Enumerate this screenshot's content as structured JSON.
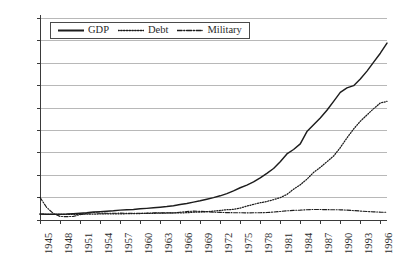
{
  "chart_data": {
    "type": "line",
    "title": "",
    "xlabel": "",
    "ylabel": "",
    "xlim": [
      1945,
      1997
    ],
    "ylim": [
      0,
      9000
    ],
    "grid": true,
    "legend_position": "top-left-inside",
    "y_ticks": [
      "9,000",
      "8,000",
      "7,000",
      "6,000",
      "5,000",
      "4,000",
      "3,000",
      "2,000",
      "1,000",
      "0"
    ],
    "y_tick_values": [
      9000,
      8000,
      7000,
      6000,
      5000,
      4000,
      3000,
      2000,
      1000,
      0
    ],
    "x_ticks": [
      "1945",
      "1948",
      "1951",
      "1954",
      "1957",
      "1960",
      "1963",
      "1966",
      "1969",
      "1972",
      "1975",
      "1978",
      "1981",
      "1984",
      "1987",
      "1990",
      "1993",
      "1996"
    ],
    "x_tick_values": [
      1945,
      1948,
      1951,
      1954,
      1957,
      1960,
      1963,
      1966,
      1969,
      1972,
      1975,
      1978,
      1981,
      1984,
      1987,
      1990,
      1993,
      1996
    ],
    "x": [
      1945,
      1946,
      1947,
      1948,
      1949,
      1950,
      1951,
      1952,
      1953,
      1954,
      1955,
      1956,
      1957,
      1958,
      1959,
      1960,
      1961,
      1962,
      1963,
      1964,
      1965,
      1966,
      1967,
      1968,
      1969,
      1970,
      1971,
      1972,
      1973,
      1974,
      1975,
      1976,
      1977,
      1978,
      1979,
      1980,
      1981,
      1982,
      1983,
      1984,
      1985,
      1986,
      1987,
      1988,
      1989,
      1990,
      1991,
      1992,
      1993,
      1994,
      1995,
      1996,
      1997
    ],
    "series": [
      {
        "name": "GDP",
        "style": "solid",
        "color": "#1d1d1d",
        "values": [
          265,
          260,
          255,
          260,
          265,
          280,
          300,
          320,
          355,
          375,
          390,
          410,
          440,
          455,
          470,
          500,
          520,
          545,
          570,
          600,
          640,
          690,
          740,
          800,
          860,
          930,
          1000,
          1080,
          1180,
          1300,
          1440,
          1560,
          1700,
          1880,
          2080,
          2300,
          2600,
          2950,
          3150,
          3400,
          3950,
          4250,
          4560,
          4900,
          5300,
          5700,
          5900,
          6000,
          6300,
          6650,
          7050,
          7450,
          7900
        ]
      },
      {
        "name": "Debt",
        "style": "dotted",
        "color": "#1d1d1d",
        "values": [
          260,
          255,
          250,
          250,
          250,
          255,
          255,
          260,
          265,
          270,
          275,
          275,
          275,
          280,
          288,
          290,
          293,
          300,
          306,
          312,
          318,
          320,
          326,
          348,
          354,
          371,
          398,
          427,
          458,
          475,
          533,
          620,
          699,
          772,
          827,
          908,
          998,
          1142,
          1377,
          1572,
          1823,
          2125,
          2350,
          2602,
          2857,
          3233,
          3665,
          4065,
          4411,
          4693,
          4974,
          5225,
          5300
        ]
      },
      {
        "name": "Military",
        "style": "dash-dot",
        "color": "#1d1d1d",
        "values": [
          1010,
          560,
          290,
          160,
          150,
          160,
          240,
          300,
          330,
          310,
          300,
          300,
          305,
          300,
          300,
          300,
          305,
          320,
          320,
          318,
          312,
          345,
          380,
          395,
          385,
          370,
          350,
          340,
          330,
          325,
          325,
          320,
          322,
          325,
          333,
          355,
          380,
          410,
          430,
          440,
          460,
          470,
          468,
          462,
          458,
          455,
          440,
          420,
          400,
          380,
          365,
          350,
          345
        ]
      }
    ]
  },
  "legend": {
    "entries": [
      {
        "label": "GDP",
        "icon": "solid-line-swatch"
      },
      {
        "label": "Debt",
        "icon": "dotted-line-swatch"
      },
      {
        "label": "Military",
        "icon": "dash-dot-line-swatch"
      }
    ]
  }
}
